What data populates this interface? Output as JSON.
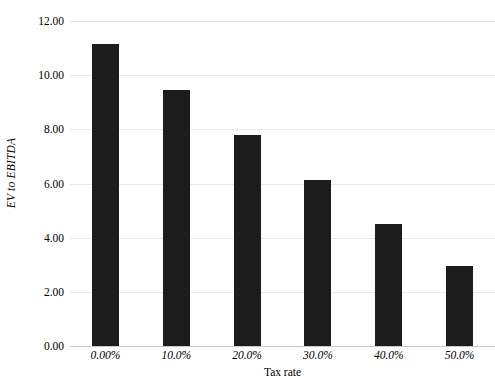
{
  "chart_data": {
    "type": "bar",
    "title": "",
    "xlabel": "Tax rate",
    "ylabel": "EV to EBITDA",
    "categories": [
      "0.00%",
      "10.0%",
      "20.0%",
      "30.0%",
      "40.0%",
      "50.0%"
    ],
    "values": [
      11.15,
      9.45,
      7.79,
      6.13,
      4.5,
      2.95
    ],
    "ylim": [
      0,
      12
    ],
    "yticks": [
      0,
      2,
      4,
      6,
      8,
      10,
      12
    ],
    "ytick_labels": [
      "0.00",
      "2.00",
      "4.00",
      "6.00",
      "8.00",
      "10.00",
      "12.00"
    ],
    "grid": true,
    "legend": "none",
    "bar_color": "#1c1c1c",
    "gridline_color": "#e9e9e9",
    "background_color": "#ffffff"
  }
}
